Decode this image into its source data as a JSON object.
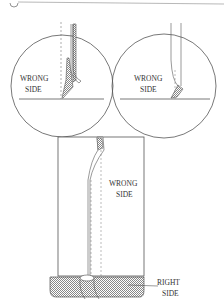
{
  "figure": {
    "type": "sewing-illustration",
    "panels": [
      {
        "id": "detail-left",
        "label_lines": [
          "WRONG",
          "SIDE"
        ]
      },
      {
        "id": "detail-right",
        "label_lines": [
          "WRONG",
          "SIDE"
        ]
      },
      {
        "id": "main-view",
        "labels": [
          {
            "id": "wrong-side",
            "lines": [
              "WRONG",
              "SIDE"
            ]
          },
          {
            "id": "right-side",
            "lines": [
              "RIGHT",
              "SIDE"
            ]
          }
        ]
      }
    ]
  },
  "colors": {
    "line": "#555555",
    "hatch": "#999999",
    "background": "#ffffff"
  }
}
